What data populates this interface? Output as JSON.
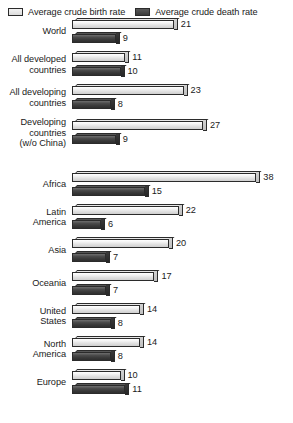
{
  "legend": {
    "entries": [
      {
        "label": "Average crude birth rate",
        "swatch": "birth-rate-swatch",
        "color": "#e2e2e2"
      },
      {
        "label": "Average crude death rate",
        "swatch": "death-rate-swatch",
        "color": "#3a3a3a"
      }
    ]
  },
  "chart_data": {
    "type": "bar",
    "orientation": "horizontal",
    "title": "",
    "xlabel": "",
    "ylabel": "",
    "xlim": [
      0,
      38
    ],
    "grid": false,
    "legend_position": "top",
    "categories": [
      "World",
      "All developed countries",
      "All developing countries",
      "Developing countries (w/o China)",
      "Africa",
      "Latin America",
      "Asia",
      "Oceania",
      "United States",
      "North America",
      "Europe"
    ],
    "series": [
      {
        "name": "Average crude birth rate",
        "values": [
          21,
          11,
          23,
          27,
          38,
          22,
          20,
          17,
          14,
          14,
          10
        ]
      },
      {
        "name": "Average crude death rate",
        "values": [
          9,
          10,
          8,
          9,
          15,
          6,
          7,
          7,
          8,
          8,
          11
        ]
      }
    ],
    "group_break_after_index": 3
  },
  "rows": [
    {
      "label_lines": [
        "World"
      ],
      "birth": "21",
      "death": "9",
      "birth_val": 21,
      "death_val": 9,
      "break_after": false
    },
    {
      "label_lines": [
        "All developed",
        "countries"
      ],
      "birth": "11",
      "death": "10",
      "birth_val": 11,
      "death_val": 10,
      "break_after": false
    },
    {
      "label_lines": [
        "All developing",
        "countries"
      ],
      "birth": "23",
      "death": "8",
      "birth_val": 23,
      "death_val": 8,
      "break_after": false
    },
    {
      "label_lines": [
        "Developing",
        "countries",
        "(w/o China)"
      ],
      "birth": "27",
      "death": "9",
      "birth_val": 27,
      "death_val": 9,
      "break_after": true
    },
    {
      "label_lines": [
        "Africa"
      ],
      "birth": "38",
      "death": "15",
      "birth_val": 38,
      "death_val": 15,
      "break_after": false
    },
    {
      "label_lines": [
        "Latin",
        "America"
      ],
      "birth": "22",
      "death": "6",
      "birth_val": 22,
      "death_val": 6,
      "break_after": false
    },
    {
      "label_lines": [
        "Asia"
      ],
      "birth": "20",
      "death": "7",
      "birth_val": 20,
      "death_val": 7,
      "break_after": false
    },
    {
      "label_lines": [
        "Oceania"
      ],
      "birth": "17",
      "death": "7",
      "birth_val": 17,
      "death_val": 7,
      "break_after": false
    },
    {
      "label_lines": [
        "United",
        "States"
      ],
      "birth": "14",
      "death": "8",
      "birth_val": 14,
      "death_val": 8,
      "break_after": false
    },
    {
      "label_lines": [
        "North",
        "America"
      ],
      "birth": "14",
      "death": "8",
      "birth_val": 14,
      "death_val": 8,
      "break_after": false
    },
    {
      "label_lines": [
        "Europe"
      ],
      "birth": "10",
      "death": "11",
      "birth_val": 10,
      "death_val": 11,
      "break_after": false
    }
  ],
  "scale": {
    "px_per_unit": 4.85
  }
}
